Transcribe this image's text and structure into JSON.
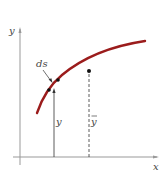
{
  "diagram": {
    "labels": {
      "y_axis": "y",
      "x_axis": "x",
      "element": "ds",
      "element_height": "y",
      "centroid_height": "ȳ"
    },
    "colors": {
      "curve": "#9b1c1c",
      "axes": "#888888",
      "lines": "#333333",
      "background": "#ffffff"
    },
    "curve_points": [
      [
        37,
        113
      ],
      [
        42,
        101
      ],
      [
        48,
        91
      ],
      [
        55,
        83
      ],
      [
        65,
        73
      ],
      [
        78,
        63
      ],
      [
        92,
        55
      ],
      [
        108,
        48
      ],
      [
        125,
        44
      ],
      [
        145,
        41
      ]
    ],
    "centroid_point": [
      89,
      71
    ],
    "element_points": [
      [
        49,
        90
      ],
      [
        58,
        80
      ]
    ]
  }
}
